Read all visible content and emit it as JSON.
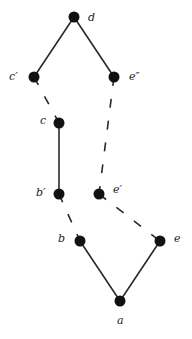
{
  "diagram": {
    "type": "graph",
    "nodes": [
      {
        "id": "d",
        "label": "d",
        "x": 74,
        "y": 17,
        "lx": 88,
        "ly": 21
      },
      {
        "id": "c1",
        "label": "c′",
        "x": 34,
        "y": 77,
        "lx": 9,
        "ly": 80
      },
      {
        "id": "e2",
        "label": "e″",
        "x": 114,
        "y": 77,
        "lx": 129,
        "ly": 80
      },
      {
        "id": "c",
        "label": "c",
        "x": 59,
        "y": 123,
        "lx": 40,
        "ly": 124
      },
      {
        "id": "b1",
        "label": "b′",
        "x": 59,
        "y": 194,
        "lx": 36,
        "ly": 196
      },
      {
        "id": "e1",
        "label": "e′",
        "x": 99,
        "y": 194,
        "lx": 113,
        "ly": 193
      },
      {
        "id": "b",
        "label": "b",
        "x": 80,
        "y": 241,
        "lx": 58,
        "ly": 242
      },
      {
        "id": "e",
        "label": "e",
        "x": 160,
        "y": 241,
        "lx": 174,
        "ly": 242
      },
      {
        "id": "a",
        "label": "a",
        "x": 120,
        "y": 301,
        "lx": 117,
        "ly": 324
      }
    ],
    "edges": [
      {
        "from": "d",
        "to": "c1",
        "style": "solid"
      },
      {
        "from": "d",
        "to": "e2",
        "style": "solid"
      },
      {
        "from": "c1",
        "to": "c",
        "style": "dashed"
      },
      {
        "from": "e2",
        "to": "e1",
        "style": "dashed"
      },
      {
        "from": "c",
        "to": "b1",
        "style": "solid"
      },
      {
        "from": "b1",
        "to": "b",
        "style": "dashed"
      },
      {
        "from": "e1",
        "to": "e",
        "style": "dashed"
      },
      {
        "from": "b",
        "to": "a",
        "style": "solid"
      },
      {
        "from": "e",
        "to": "a",
        "style": "solid"
      }
    ]
  }
}
